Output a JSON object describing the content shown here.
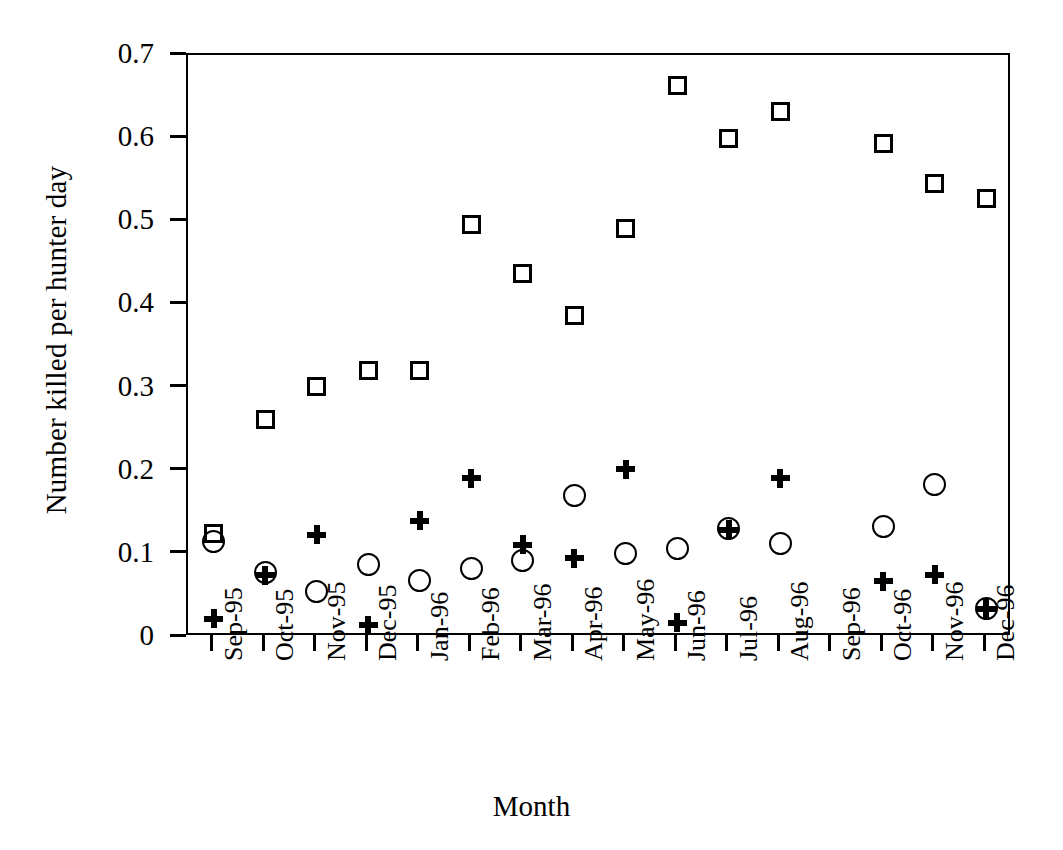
{
  "chart_data": {
    "type": "scatter",
    "title": "",
    "xlabel": "Month",
    "ylabel": "Number killed per hunter day",
    "grid": false,
    "legend": "none",
    "ylim": [
      0,
      0.7
    ],
    "yticks": [
      "0",
      "0.1",
      "0.2",
      "0.3",
      "0.4",
      "0.5",
      "0.6",
      "0.7"
    ],
    "ytick_values": [
      0,
      0.1,
      0.2,
      0.3,
      0.4,
      0.5,
      0.6,
      0.7
    ],
    "categories": [
      "Sep-95",
      "Oct-95",
      "Nov-95",
      "Dec-95",
      "Jan-96",
      "Feb-96",
      "Mar-96",
      "Apr-96",
      "May-96",
      "Jun-96",
      "Jul-96",
      "Aug-96",
      "Sep-96",
      "Oct-96",
      "Nov-96",
      "Dec-96"
    ],
    "series": [
      {
        "name": "square-series",
        "marker": "open-square",
        "values": [
          0.125,
          0.262,
          0.301,
          0.32,
          0.32,
          0.496,
          0.437,
          0.387,
          0.491,
          0.663,
          0.599,
          0.632,
          null,
          0.594,
          0.545,
          0.527
        ]
      },
      {
        "name": "circle-series",
        "marker": "open-circle",
        "values": [
          0.115,
          0.078,
          0.055,
          0.087,
          0.068,
          0.082,
          0.092,
          0.17,
          0.101,
          0.107,
          0.131,
          0.112,
          null,
          0.133,
          0.184,
          0.034
        ]
      },
      {
        "name": "plus-series",
        "marker": "plus",
        "values": [
          0.022,
          0.074,
          0.123,
          0.014,
          0.14,
          0.191,
          0.111,
          0.095,
          0.202,
          0.017,
          0.129,
          0.191,
          null,
          0.067,
          0.075,
          0.034
        ]
      }
    ]
  },
  "colors": {
    "axis": "#000000",
    "marker": "#000000",
    "background": "#ffffff"
  }
}
